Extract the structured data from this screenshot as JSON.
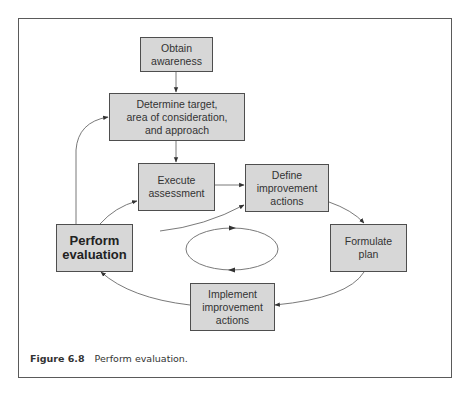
{
  "diagram": {
    "type": "process-cycle",
    "colors": {
      "box_fill": "#d7d7d7",
      "box_border": "#4e4e4e",
      "line": "#6a6a6a",
      "frame": "#5a5a5a"
    },
    "nodes": {
      "obtain": {
        "label": "Obtain\nawareness"
      },
      "determine": {
        "label": "Determine target,\narea of consideration,\nand approach"
      },
      "execute": {
        "label": "Execute\nassessment"
      },
      "define": {
        "label": "Define\nimprovement\nactions"
      },
      "formulate": {
        "label": "Formulate\nplan"
      },
      "implement": {
        "label": "Implement\nimprovement\nactions"
      },
      "perform": {
        "label": "Perform\nevaluation"
      }
    },
    "edges": [
      {
        "from": "obtain",
        "to": "determine"
      },
      {
        "from": "determine",
        "to": "execute"
      },
      {
        "from": "execute",
        "to": "define"
      },
      {
        "from": "define",
        "to": "formulate"
      },
      {
        "from": "formulate",
        "to": "implement"
      },
      {
        "from": "implement",
        "to": "perform"
      },
      {
        "from": "perform",
        "to": "execute"
      },
      {
        "from": "perform",
        "to": "define"
      },
      {
        "from": "perform",
        "to": "determine"
      }
    ],
    "center_symbol": "cycle-ellipse"
  },
  "caption": {
    "figure_label": "Figure 6.8",
    "text": "Perform evaluation."
  }
}
